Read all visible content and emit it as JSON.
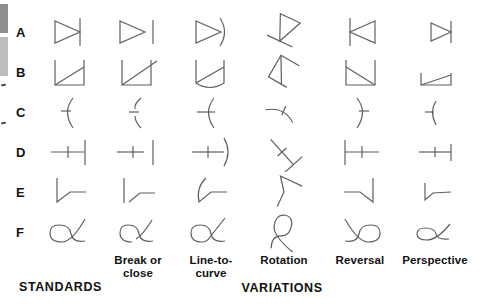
{
  "figure_title": "letter-like forms: standards and variations",
  "colors": {
    "stroke": "#5f5f5f",
    "text": "#111111",
    "edge_bar_dark": "#8e8e8e",
    "edge_bar_light": "#bdbdbd"
  },
  "rows": [
    {
      "label": "A",
      "shape": "triangle-with-bar"
    },
    {
      "label": "B",
      "shape": "open-square-with-diagonal"
    },
    {
      "label": "C",
      "shape": "curve-with-tick"
    },
    {
      "label": "D",
      "shape": "line-with-cross-and-bar"
    },
    {
      "label": "E",
      "shape": "bent-line"
    },
    {
      "label": "F",
      "shape": "alpha-loop"
    }
  ],
  "columns": [
    {
      "id": "standard",
      "label": ""
    },
    {
      "id": "break-or-close",
      "label": "Break or close"
    },
    {
      "id": "line-to-curve",
      "label": "Line-to-curve"
    },
    {
      "id": "rotation",
      "label": "Rotation"
    },
    {
      "id": "reversal",
      "label": "Reversal"
    },
    {
      "id": "perspective",
      "label": "Perspective"
    }
  ],
  "sections": {
    "standards": "STANDARDS",
    "variations": "VARIATIONS"
  }
}
